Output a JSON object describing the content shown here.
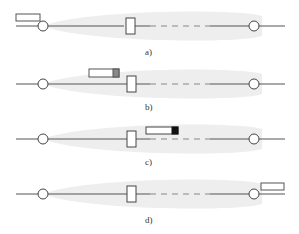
{
  "panels": [
    {
      "label": "a)",
      "y": 26,
      "box_x": 129,
      "indicator": {
        "x": 16,
        "y": 14,
        "w": 24,
        "h": 7,
        "fill_end": "none"
      }
    },
    {
      "label": "b)",
      "y": 84,
      "box_x": 131,
      "indicator": {
        "x": 89,
        "y": 69,
        "w": 30,
        "h": 8,
        "fill_end": "#888888"
      }
    },
    {
      "label": "c)",
      "y": 139,
      "box_x": 131,
      "indicator": {
        "x": 146,
        "y": 127,
        "w": 32,
        "h": 7,
        "fill_end": "#111111"
      }
    },
    {
      "label": "d)",
      "y": 194,
      "box_x": 131,
      "indicator": {
        "x": 261,
        "y": 183,
        "w": 23,
        "h": 7,
        "fill_end": "none"
      }
    }
  ],
  "colors": {
    "line": "#555555",
    "envelope": "#eeeeee",
    "stroke": "#444444"
  }
}
